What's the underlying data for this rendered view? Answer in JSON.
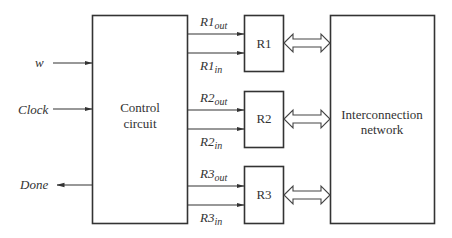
{
  "diagram": {
    "inputs": [
      {
        "id": "w",
        "label": "w",
        "direction": "in"
      },
      {
        "id": "clock",
        "label": "Clock",
        "direction": "in"
      },
      {
        "id": "done",
        "label": "Done",
        "direction": "out"
      }
    ],
    "control": {
      "line1": "Control",
      "line2": "circuit"
    },
    "interconnect": {
      "line1": "Interconnection",
      "line2": "network"
    },
    "registers": [
      {
        "label": "R1",
        "out_base": "R1",
        "out_sub": "out",
        "in_base": "R1",
        "in_sub": "in"
      },
      {
        "label": "R2",
        "out_base": "R2",
        "out_sub": "out",
        "in_base": "R2",
        "in_sub": "in"
      },
      {
        "label": "R3",
        "out_base": "R3",
        "out_sub": "out",
        "in_base": "R3",
        "in_sub": "in"
      }
    ]
  }
}
